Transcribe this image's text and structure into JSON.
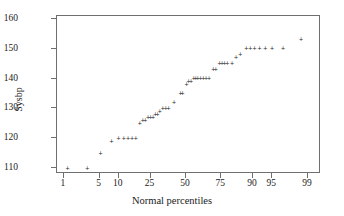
{
  "chart_data": {
    "type": "scatter",
    "title": "",
    "xlabel": "Normal percentiles",
    "ylabel": "Sysbp",
    "grid": false,
    "legend": null,
    "marker": "plus",
    "x_scale": "normal-probability",
    "xlim": [
      0.7,
      99.5
    ],
    "ylim": [
      108,
      161
    ],
    "xticks": [
      1,
      5,
      10,
      25,
      50,
      75,
      90,
      95,
      99
    ],
    "xtick_labels": [
      "1",
      "5",
      "10",
      "25",
      "50",
      "75",
      "90",
      "95",
      "99"
    ],
    "yticks": [
      110,
      120,
      130,
      140,
      150,
      160
    ],
    "ytick_labels": [
      "110",
      "120",
      "130",
      "140",
      "150",
      "160"
    ],
    "points": [
      {
        "x": 1.2,
        "y": 110
      },
      {
        "x": 3.0,
        "y": 110
      },
      {
        "x": 5.2,
        "y": 115
      },
      {
        "x": 7.8,
        "y": 119
      },
      {
        "x": 10.0,
        "y": 120
      },
      {
        "x": 11.8,
        "y": 120
      },
      {
        "x": 13.5,
        "y": 120
      },
      {
        "x": 15.2,
        "y": 120
      },
      {
        "x": 17.0,
        "y": 120
      },
      {
        "x": 19.0,
        "y": 125
      },
      {
        "x": 20.5,
        "y": 126
      },
      {
        "x": 22.0,
        "y": 126
      },
      {
        "x": 23.5,
        "y": 127
      },
      {
        "x": 25.0,
        "y": 127
      },
      {
        "x": 26.5,
        "y": 127
      },
      {
        "x": 28.0,
        "y": 128
      },
      {
        "x": 29.5,
        "y": 128
      },
      {
        "x": 31.0,
        "y": 129
      },
      {
        "x": 33.0,
        "y": 130
      },
      {
        "x": 35.0,
        "y": 130
      },
      {
        "x": 37.0,
        "y": 130
      },
      {
        "x": 41.0,
        "y": 132
      },
      {
        "x": 46.0,
        "y": 135
      },
      {
        "x": 47.5,
        "y": 135
      },
      {
        "x": 50.5,
        "y": 138
      },
      {
        "x": 52.0,
        "y": 139
      },
      {
        "x": 54.0,
        "y": 139
      },
      {
        "x": 56.0,
        "y": 140
      },
      {
        "x": 57.5,
        "y": 140
      },
      {
        "x": 59.0,
        "y": 140
      },
      {
        "x": 61.0,
        "y": 140
      },
      {
        "x": 63.0,
        "y": 140
      },
      {
        "x": 65.0,
        "y": 140
      },
      {
        "x": 67.0,
        "y": 140
      },
      {
        "x": 70.0,
        "y": 143
      },
      {
        "x": 71.5,
        "y": 143
      },
      {
        "x": 74.0,
        "y": 145
      },
      {
        "x": 75.5,
        "y": 145
      },
      {
        "x": 77.0,
        "y": 145
      },
      {
        "x": 78.5,
        "y": 145
      },
      {
        "x": 81.0,
        "y": 145
      },
      {
        "x": 83.0,
        "y": 147
      },
      {
        "x": 85.0,
        "y": 148
      },
      {
        "x": 87.5,
        "y": 150
      },
      {
        "x": 89.0,
        "y": 150
      },
      {
        "x": 90.5,
        "y": 150
      },
      {
        "x": 92.0,
        "y": 150
      },
      {
        "x": 93.5,
        "y": 150
      },
      {
        "x": 95.0,
        "y": 150
      },
      {
        "x": 96.8,
        "y": 150
      },
      {
        "x": 98.6,
        "y": 153
      }
    ]
  },
  "style": {
    "frame_color": "#6f6f6f",
    "marker_color": "#2b2b2b",
    "text_color": "#1a1a1a",
    "background": "#ffffff"
  }
}
